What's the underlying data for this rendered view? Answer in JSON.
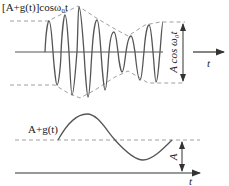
{
  "top_panel": {
    "signal_label": "[A+g(t)]cosω₀t",
    "envelope_label": "A cos ω₀t",
    "axis_label": "t"
  },
  "bottom_panel": {
    "signal_label": "A+g(t)",
    "offset_label": "A",
    "axis_label": "t"
  },
  "colors": {
    "wave": "#555555",
    "axis": "#444444",
    "dashed": "#777777"
  }
}
